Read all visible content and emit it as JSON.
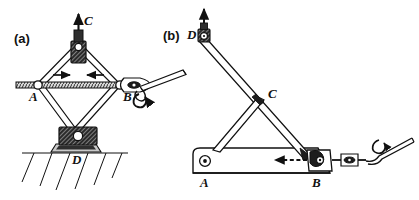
{
  "figure": {
    "type": "mechanical-engineering-line-diagram",
    "background_color": "#ffffff",
    "ink_color": "#111111",
    "panels": [
      {
        "id": "a",
        "label": "(a)",
        "name": "scissor-jack",
        "points": [
          {
            "label": "A",
            "role": "left-slider-pivot-on-screw"
          },
          {
            "label": "B",
            "role": "right-nut-pivot-driven-by-crank"
          },
          {
            "label": "C",
            "role": "top-load-pivot-block"
          },
          {
            "label": "D",
            "role": "bottom-ground-pivot-block"
          }
        ],
        "arrows": [
          {
            "name": "load-arrow",
            "direction": "up",
            "label": "C"
          },
          {
            "name": "screw-arrow-left",
            "direction": "right"
          },
          {
            "name": "screw-arrow-right",
            "direction": "left"
          },
          {
            "name": "crank-rotation-arrow",
            "direction": "curved-ccw"
          }
        ],
        "features": [
          "threaded-screw-rod",
          "crank-handle",
          "ground-hatching",
          "hatched-pivot-blocks"
        ]
      },
      {
        "id": "b",
        "label": "(b)",
        "name": "lever-jack",
        "points": [
          {
            "label": "A",
            "role": "base-beam-rear-pivot"
          },
          {
            "label": "B",
            "role": "travelling-nut-block-on-beam"
          },
          {
            "label": "C",
            "role": "brace-to-arm-pivot"
          },
          {
            "label": "D",
            "role": "lifting-head-pivot"
          }
        ],
        "arrows": [
          {
            "name": "load-arrow",
            "direction": "up"
          },
          {
            "name": "nut-travel-arrow",
            "direction": "left",
            "style": "dashed"
          },
          {
            "name": "crank-rotation-arrow",
            "direction": "curved-ccw"
          }
        ],
        "features": [
          "base-beam",
          "main-lifting-arm",
          "diagonal-brace",
          "crank-handle",
          "turnbuckle-link"
        ]
      }
    ]
  },
  "labels": {
    "panel_a": "(a)",
    "panel_b": "(b)",
    "a_point_A": "A",
    "a_point_B": "B",
    "a_point_C": "C",
    "a_point_D": "D",
    "b_point_A": "A",
    "b_point_B": "B",
    "b_point_C": "C",
    "b_point_D": "D"
  }
}
